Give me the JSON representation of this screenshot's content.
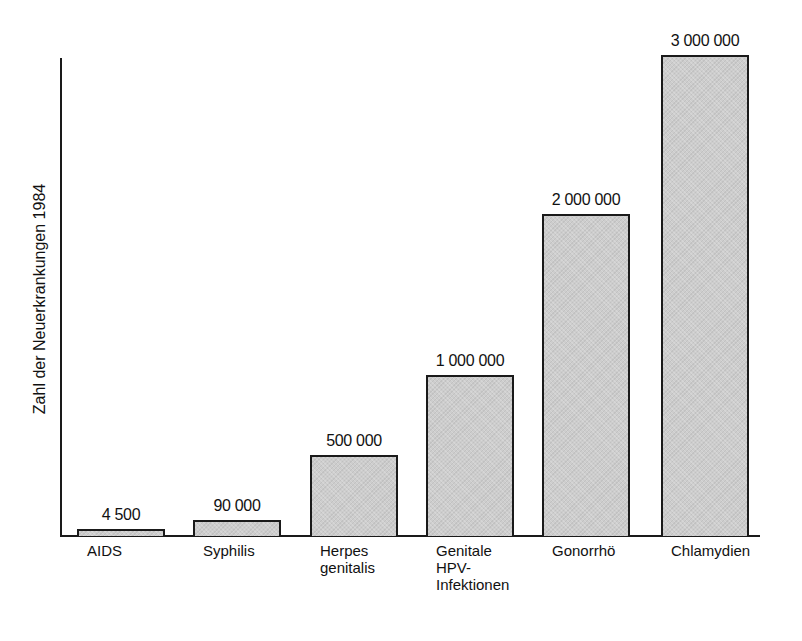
{
  "chart_data": {
    "type": "bar",
    "title": "",
    "xlabel": "",
    "ylabel": "Zahl der Neuerkrankungen 1984",
    "categories": [
      "AIDS",
      "Syphilis",
      "Herpes genitalis",
      "Genitale HPV-Infektionen",
      "Gonorrhö",
      "Chlamydien"
    ],
    "category_labels": [
      "AIDS",
      "Syphilis",
      "Herpes\ngenitalis",
      "Genitale\nHPV-\nInfektionen",
      "Gonorrhö",
      "Chlamydien"
    ],
    "values": [
      4500,
      90000,
      500000,
      1000000,
      2000000,
      3000000
    ],
    "value_labels": [
      "4 500",
      "90 000",
      "500 000",
      "1 000 000",
      "2 000 000",
      "3 000 000"
    ],
    "ylim": [
      0,
      3000000
    ],
    "grid": false,
    "legend": null,
    "bar_color": "#cdcdcd",
    "bar_border_color": "#1a1a1a"
  },
  "layout": {
    "bars": [
      {
        "left": 77,
        "width": 88,
        "top": 529
      },
      {
        "left": 193,
        "width": 88,
        "top": 520
      },
      {
        "left": 310,
        "width": 88,
        "top": 455
      },
      {
        "left": 426,
        "width": 88,
        "top": 375
      },
      {
        "left": 542,
        "width": 88,
        "top": 214
      },
      {
        "left": 661,
        "width": 88,
        "top": 55
      }
    ],
    "baseline": 536
  }
}
